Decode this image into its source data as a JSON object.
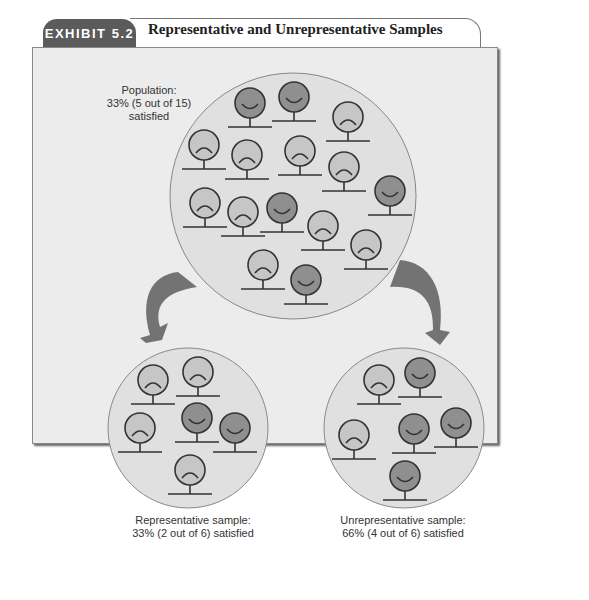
{
  "header": {
    "exhibit_label": "EXHIBIT 5.2",
    "title": "Representative and Unrepresentative Samples"
  },
  "colors": {
    "tab_bg": "#5b5b5b",
    "frame_bg": "#ececec",
    "circle_bg": "#e0e0e0",
    "satisfied_face": "#8f8f8f",
    "dissatisfied_face": "#c6c6c6",
    "arrow": "#737373",
    "stroke": "#333333"
  },
  "population": {
    "label_line1": "Population:",
    "label_line2": "33% (5 out of 15)",
    "label_line3": "satisfied",
    "total": 15,
    "satisfied": 5
  },
  "representative_sample": {
    "label_line1": "Representative sample:",
    "label_line2": "33% (2 out of 6) satisfied",
    "total": 6,
    "satisfied": 2
  },
  "unrepresentative_sample": {
    "label_line1": "Unrepresentative sample:",
    "label_line2": "66% (4 out of 6) satisfied",
    "total": 6,
    "satisfied": 4
  }
}
